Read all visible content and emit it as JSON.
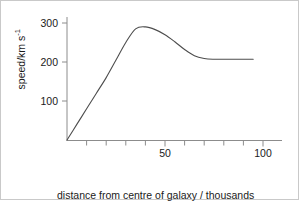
{
  "chart_data": {
    "type": "line",
    "title": "",
    "subtitle": "",
    "xlabel": "distance from centre of galaxy / thousands of light years",
    "ylabel_text": "speed/km s",
    "ylabel_exponent": "-1",
    "ylabel": "speed/km s^-1",
    "xlim": [
      0,
      100
    ],
    "ylim": [
      0,
      320
    ],
    "grid": false,
    "legend": false,
    "x_major_ticks": [
      50,
      100
    ],
    "x_major_tick_labels": [
      "50",
      "100"
    ],
    "x_minor_ticks": [
      10,
      20,
      30,
      40,
      60,
      70,
      80,
      90
    ],
    "y_major_ticks": [
      100,
      200,
      300
    ],
    "y_major_tick_labels": [
      "100",
      "200",
      "300"
    ],
    "series": [
      {
        "name": "galaxy rotation curve",
        "color": "#4d4d4d",
        "x": [
          0,
          5,
          10,
          15,
          20,
          25,
          30,
          35,
          40,
          45,
          50,
          55,
          60,
          65,
          70,
          75,
          80,
          85,
          90,
          95
        ],
        "values": [
          0,
          40,
          80,
          120,
          160,
          205,
          250,
          285,
          290,
          283,
          270,
          252,
          232,
          216,
          209,
          207,
          207,
          207,
          207,
          207
        ]
      }
    ],
    "annotations": {
      "peak_speed": 290,
      "peak_distance": 35,
      "plateau_speed": 207,
      "curve_end_distance": 95
    }
  },
  "ticks": {
    "y": [
      {
        "label": "300"
      },
      {
        "label": "200"
      },
      {
        "label": "100"
      }
    ],
    "x": [
      {
        "label": "50"
      },
      {
        "label": "100"
      }
    ]
  },
  "labels": {
    "x_axis_line_1": "distance from centre of galaxy / thousands",
    "x_axis_line_2": "of light years",
    "y_axis_main": "speed/km s",
    "y_axis_sup": "-1"
  }
}
